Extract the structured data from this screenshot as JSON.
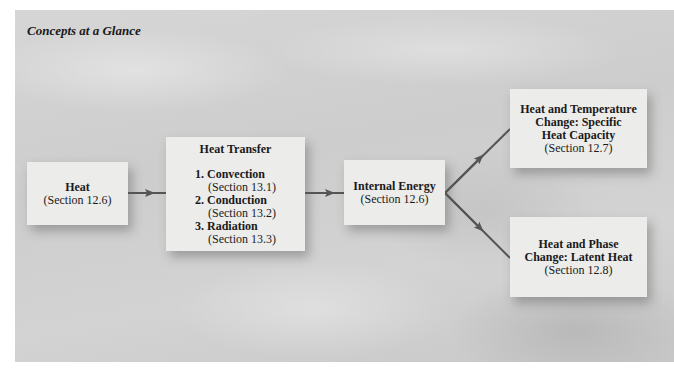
{
  "title": "Concepts at a Glance",
  "nodes": {
    "heat": {
      "title": "Heat",
      "section": "(Section 12.6)"
    },
    "heat_transfer": {
      "title": "Heat Transfer",
      "items": [
        {
          "label": "1. Convection",
          "section": "(Section 13.1)"
        },
        {
          "label": "2. Conduction",
          "section": "(Section 13.2)"
        },
        {
          "label": "3. Radiation",
          "section": "(Section 13.3)"
        }
      ]
    },
    "internal_energy": {
      "title": "Internal Energy",
      "section": "(Section 12.6)"
    },
    "specific_heat": {
      "lines": [
        "Heat and Temperature",
        "Change: Specific",
        "Heat Capacity"
      ],
      "section": "(Section 12.7)"
    },
    "latent_heat": {
      "lines": [
        "Heat and Phase",
        "Change: Latent Heat"
      ],
      "section": "(Section 12.8)"
    }
  },
  "edges": [
    {
      "from": "heat",
      "to": "heat_transfer"
    },
    {
      "from": "heat_transfer",
      "to": "internal_energy"
    },
    {
      "from": "internal_energy",
      "to": "specific_heat"
    },
    {
      "from": "internal_energy",
      "to": "latent_heat"
    }
  ],
  "colors": {
    "arrow": "#555555",
    "box": "#ececea",
    "background": "#d0d0d0"
  }
}
